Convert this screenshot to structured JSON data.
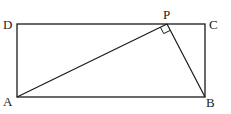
{
  "figure": {
    "type": "geometry-diagram",
    "stroke_color": "#1a1a1a",
    "label_color": "#222222",
    "points": {
      "A": {
        "label": "A",
        "x": 17,
        "y": 97
      },
      "B": {
        "label": "B",
        "x": 205,
        "y": 97
      },
      "C": {
        "label": "C",
        "x": 205,
        "y": 24
      },
      "D": {
        "label": "D",
        "x": 17,
        "y": 24
      },
      "P": {
        "label": "P",
        "x": 167,
        "y": 24
      }
    },
    "segments": [
      "AB",
      "BC",
      "CD",
      "DA",
      "AP",
      "PB"
    ],
    "right_angle_marker": {
      "at": "P",
      "between": [
        "PA",
        "PB"
      ]
    }
  }
}
